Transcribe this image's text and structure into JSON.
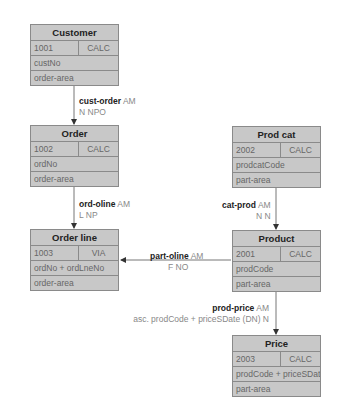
{
  "records": [
    {
      "key": "customer",
      "name": "Customer",
      "id": "1001",
      "location": "CALC",
      "fields": [
        "custNo",
        "order-area"
      ]
    },
    {
      "key": "order",
      "name": "Order",
      "id": "1002",
      "location": "CALC",
      "fields": [
        "ordNo",
        "order-area"
      ]
    },
    {
      "key": "order-line",
      "name": "Order line",
      "id": "1003",
      "location": "VIA",
      "fields": [
        "ordNo + ordLneNo",
        "order-area"
      ]
    },
    {
      "key": "prod-cat",
      "name": "Prod cat",
      "id": "2002",
      "location": "CALC",
      "fields": [
        "prodcatCode",
        "part-area"
      ]
    },
    {
      "key": "product",
      "name": "Product",
      "id": "2001",
      "location": "CALC",
      "fields": [
        "prodCode",
        "part-area"
      ]
    },
    {
      "key": "price",
      "name": "Price",
      "id": "2003",
      "location": "CALC",
      "fields": [
        "prodCode + priceSDate",
        "part-area"
      ]
    }
  ],
  "sets": [
    {
      "name": "cust-order",
      "mode": "AM",
      "options": "N  NPO"
    },
    {
      "name": "ord-oline",
      "mode": "AM",
      "options": "L   NP"
    },
    {
      "name": "cat-prod",
      "mode": "AM",
      "options": "N  N"
    },
    {
      "name": "part-oline",
      "mode": "AM",
      "options": "F  NO"
    },
    {
      "name": "prod-price",
      "mode": "AM",
      "options": "asc. prodCode + priceSDate (DN) N"
    }
  ],
  "colors": {
    "box_fill": "#c8c8c8",
    "box_border": "#8a8a8a",
    "line": "#555555"
  }
}
